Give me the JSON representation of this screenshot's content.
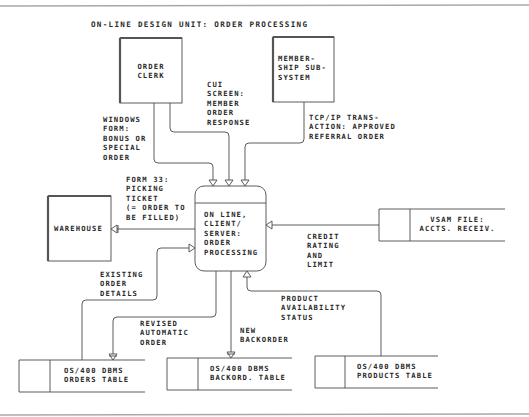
{
  "title": "ON-LINE DESIGN UNIT: ORDER PROCESSING",
  "colors": {
    "line": "#4a4a4a",
    "frame": "#9a9a9a",
    "text": "#2a2a2a",
    "shadow": "#555555"
  },
  "external_entities": {
    "order_clerk": {
      "label": "ORDER\nCLERK"
    },
    "membership": {
      "label": "MEMBER-\nSHIP SUB-\nSYSTEM"
    },
    "warehouse": {
      "label": "WAREHOUSE"
    }
  },
  "process": {
    "label": "ON LINE,\nCLIENT/\nSERVER:\nORDER\nPROCESSING"
  },
  "data_stores": {
    "vsam": {
      "label": "VSAM FILE:\nACCTS. RECEIV."
    },
    "orders": {
      "label": "OS/400 DBMS\nORDERS TABLE"
    },
    "backord": {
      "label": "OS/400 DBMS\nBACKORD. TABLE"
    },
    "products": {
      "label": "OS/400 DBMS\nPRODUCTS TABLE"
    }
  },
  "flows": {
    "windows_form": "WINDOWS\nFORM:\nBONUS OR\nSPECIAL\nORDER",
    "cui_screen": "CUI\nSCREEN:\nMEMBER\nORDER\nRESPONSE",
    "tcpip": "TCP/IP TRANS-\nACTION: APPROVED\nREFERRAL ORDER",
    "form33": "FORM 33:\nPICKING\nTICKET\n(= ORDER TO\nBE FILLED)",
    "credit": "CREDIT\nRATING\nAND\nLIMIT",
    "existing": "EXISTING\nORDER\nDETAILS",
    "revised": "REVISED\nAUTOMATIC\nORDER",
    "new_backorder": "NEW\nBACKORDER",
    "product_avail": "PRODUCT\nAVAILABILITY\nSTATUS"
  }
}
